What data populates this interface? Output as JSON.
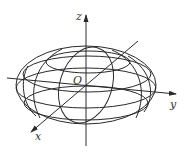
{
  "diagram": {
    "type": "ellipsoid",
    "labels": {
      "z": "z",
      "y": "y",
      "x": "x",
      "origin": "O"
    },
    "colors": {
      "stroke": "#2a2a2a",
      "background": "#ffffff"
    }
  }
}
